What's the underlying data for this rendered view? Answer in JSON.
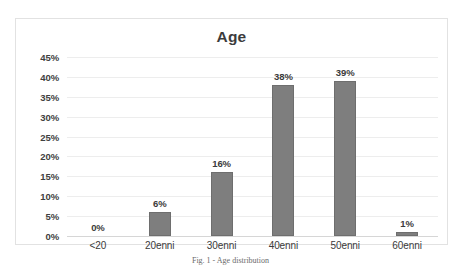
{
  "figure": {
    "caption": "Fig. 1 - Age distribution"
  },
  "chart_data": {
    "type": "bar",
    "title": "Age",
    "xlabel": "",
    "ylabel": "",
    "categories": [
      "<20",
      "20enni",
      "30enni",
      "40enni",
      "50enni",
      "60enni"
    ],
    "values": [
      0,
      6,
      16,
      38,
      39,
      1
    ],
    "data_labels": [
      "0%",
      "6%",
      "16%",
      "38%",
      "39%",
      "1%"
    ],
    "ylim": [
      0,
      45
    ],
    "y_ticks": [
      0,
      5,
      10,
      15,
      20,
      25,
      30,
      35,
      40,
      45
    ],
    "y_tick_labels": [
      "0%",
      "5%",
      "10%",
      "15%",
      "20%",
      "25%",
      "30%",
      "35%",
      "40%",
      "45%"
    ],
    "grid": true,
    "legend": null,
    "legend_position": "none",
    "series_color": "#7e7e7e",
    "gridline_color": "#ededed",
    "axis_color": "#d6d6d6",
    "plot_background": "#ffffff",
    "text_color": "#3a3a3a"
  }
}
